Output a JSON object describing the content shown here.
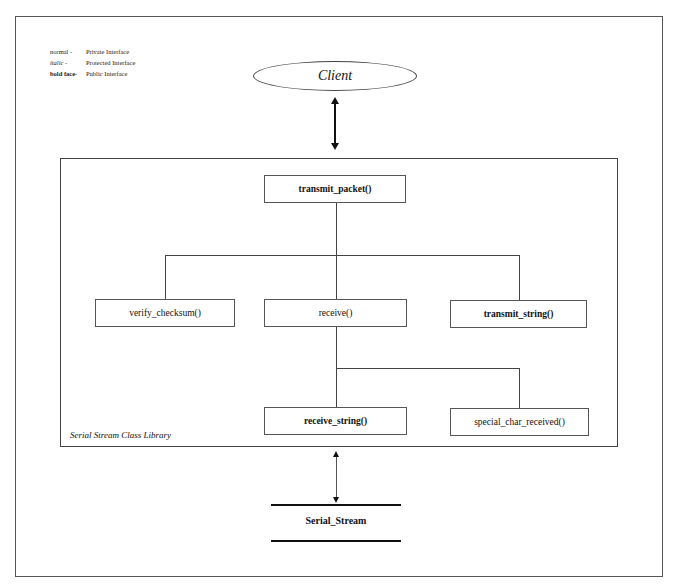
{
  "legend": [
    {
      "key": "normal -",
      "style": "normal",
      "meaning": "Private Interface"
    },
    {
      "key": "italic -",
      "style": "italic",
      "meaning": "Protected Interface"
    },
    {
      "key": "bold face-",
      "style": "bold",
      "meaning": "Public Interface"
    }
  ],
  "client": {
    "label": "Client"
  },
  "library": {
    "label": "Serial Stream Class Library"
  },
  "nodes": {
    "transmit_packet": {
      "label": "transmit_packet()",
      "interface": "public"
    },
    "verify_checksum": {
      "label": "verify_checksum()",
      "interface": "private"
    },
    "receive": {
      "label": "receive()",
      "interface": "private"
    },
    "transmit_string": {
      "label": "transmit_string()",
      "interface": "public"
    },
    "receive_string": {
      "label": "receive_string()",
      "interface": "public"
    },
    "special_char_received": {
      "label": "special_char_received()",
      "interface": "private"
    }
  },
  "stream": {
    "label": "Serial_Stream"
  },
  "edges": [
    {
      "from": "client",
      "to": "library",
      "type": "bidirectional-arrow"
    },
    {
      "from": "transmit_packet",
      "to": "verify_checksum"
    },
    {
      "from": "transmit_packet",
      "to": "receive"
    },
    {
      "from": "transmit_packet",
      "to": "transmit_string"
    },
    {
      "from": "receive",
      "to": "receive_string"
    },
    {
      "from": "receive",
      "to": "special_char_received"
    },
    {
      "from": "library",
      "to": "stream",
      "type": "bidirectional-arrow"
    }
  ]
}
